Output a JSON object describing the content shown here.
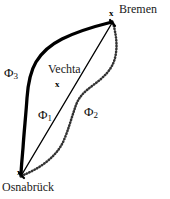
{
  "figure": {
    "width": 170,
    "height": 199,
    "background_color": "#ffffff",
    "ink_color": "#000000"
  },
  "cities": [
    {
      "name": "Bremen",
      "label": "Bremen",
      "marker": "x",
      "marker_glyph": "x",
      "position": {
        "x": 112,
        "y": 22
      }
    },
    {
      "name": "Osnabrueck",
      "label": "Osnabrück",
      "marker": "x",
      "marker_glyph": "x",
      "position": {
        "x": 21,
        "y": 176
      }
    },
    {
      "name": "Vechta",
      "label": "Vechta",
      "marker": "x",
      "marker_glyph": "x",
      "position": {
        "x": 58,
        "y": 84
      }
    }
  ],
  "paths": [
    {
      "id": "phi1",
      "label": "Φ",
      "subscript": "1",
      "style": "thin-solid",
      "description": "straight thin line from Osnabrueck to Bremen passing near Vechta",
      "stroke_color": "#000000",
      "stroke_width": 1.4,
      "label_position": {
        "x": 38,
        "y": 108
      }
    },
    {
      "id": "phi2",
      "label": "Φ",
      "subscript": "2",
      "style": "dotted",
      "description": "dotted curve bulging east of the straight line",
      "stroke_color": "#3a3a3a",
      "stroke_width": 2.4,
      "label_position": {
        "x": 84,
        "y": 105
      }
    },
    {
      "id": "phi3",
      "label": "Φ",
      "subscript": "3",
      "style": "thick-solid",
      "description": "thick bold curve bulging west of the straight line",
      "stroke_color": "#000000",
      "stroke_width": 3.2,
      "label_position": {
        "x": 4,
        "y": 66
      }
    }
  ]
}
